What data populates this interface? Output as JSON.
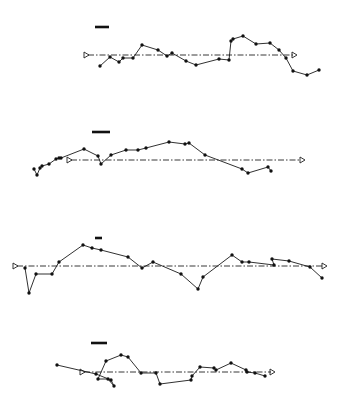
{
  "figure": {
    "width": 350,
    "height": 413,
    "background": "#ffffff",
    "ink": "#111111"
  },
  "chart_data": [
    {
      "type": "line",
      "panel": 1,
      "title": "",
      "xlabel": "",
      "ylabel": "",
      "grid": false,
      "legend": null,
      "scale_bar": {
        "x1": 95,
        "x2": 109,
        "y": 27
      },
      "baseline": {
        "x1": 84,
        "x2": 297,
        "y": 55
      },
      "points": [
        [
          100,
          66
        ],
        [
          110,
          57
        ],
        [
          119,
          62
        ],
        [
          123,
          58
        ],
        [
          133,
          58
        ],
        [
          142,
          45
        ],
        [
          158,
          50
        ],
        [
          167,
          56
        ],
        [
          172,
          53
        ],
        [
          186,
          61
        ],
        [
          196,
          65
        ],
        [
          219,
          59
        ],
        [
          229,
          60
        ],
        [
          231,
          41
        ],
        [
          233,
          39
        ],
        [
          243,
          36
        ],
        [
          256,
          44
        ],
        [
          270,
          43
        ],
        [
          279,
          50
        ],
        [
          286,
          58
        ],
        [
          293,
          71
        ],
        [
          307,
          75
        ],
        [
          319,
          70
        ]
      ]
    },
    {
      "type": "line",
      "panel": 2,
      "title": "",
      "xlabel": "",
      "ylabel": "",
      "grid": false,
      "legend": null,
      "scale_bar": {
        "x1": 92,
        "x2": 110,
        "y": 132
      },
      "baseline": {
        "x1": 67,
        "x2": 305,
        "y": 160
      },
      "points": [
        [
          34,
          169
        ],
        [
          37,
          175
        ],
        [
          40,
          168
        ],
        [
          42,
          166
        ],
        [
          49,
          164
        ],
        [
          56,
          159
        ],
        [
          59,
          158
        ],
        [
          61,
          158
        ],
        [
          84,
          149
        ],
        [
          98,
          156
        ],
        [
          101,
          164
        ],
        [
          111,
          155
        ],
        [
          126,
          150
        ],
        [
          138,
          150
        ],
        [
          146,
          148
        ],
        [
          169,
          142
        ],
        [
          185,
          144
        ],
        [
          189,
          143
        ],
        [
          205,
          155
        ],
        [
          242,
          169
        ],
        [
          248,
          173
        ],
        [
          268,
          167
        ],
        [
          271,
          171
        ]
      ]
    },
    {
      "type": "line",
      "panel": 3,
      "title": "",
      "xlabel": "",
      "ylabel": "",
      "grid": false,
      "legend": null,
      "scale_bar": {
        "x1": 95,
        "x2": 102,
        "y": 238
      },
      "baseline": {
        "x1": 13,
        "x2": 327,
        "y": 266
      },
      "points": [
        [
          25,
          268
        ],
        [
          29,
          293
        ],
        [
          36,
          274
        ],
        [
          52,
          274
        ],
        [
          59,
          262
        ],
        [
          83,
          245
        ],
        [
          92,
          248
        ],
        [
          101,
          250
        ],
        [
          128,
          257
        ],
        [
          142,
          268
        ],
        [
          153,
          262
        ],
        [
          181,
          274
        ],
        [
          198,
          289
        ],
        [
          203,
          277
        ],
        [
          232,
          255
        ],
        [
          242,
          262
        ],
        [
          249,
          262
        ],
        [
          274,
          265
        ],
        [
          272,
          259
        ],
        [
          289,
          261
        ],
        [
          310,
          267
        ],
        [
          322,
          278
        ]
      ]
    },
    {
      "type": "line",
      "panel": 4,
      "title": "",
      "xlabel": "",
      "ylabel": "",
      "grid": false,
      "legend": null,
      "scale_bar": {
        "x1": 91,
        "x2": 107,
        "y": 343
      },
      "baseline": {
        "x1": 80,
        "x2": 275,
        "y": 372
      },
      "points": [
        [
          57,
          365
        ],
        [
          96,
          374
        ],
        [
          111,
          380
        ],
        [
          114,
          386
        ],
        [
          108,
          379
        ],
        [
          98,
          379
        ],
        [
          106,
          361
        ],
        [
          121,
          355
        ],
        [
          128,
          357
        ],
        [
          141,
          373
        ],
        [
          156,
          373
        ],
        [
          160,
          384
        ],
        [
          191,
          380
        ],
        [
          192,
          376
        ],
        [
          200,
          367
        ],
        [
          214,
          368
        ],
        [
          216,
          370
        ],
        [
          231,
          363
        ],
        [
          246,
          370
        ],
        [
          247,
          372
        ],
        [
          255,
          373
        ],
        [
          265,
          376
        ]
      ]
    }
  ]
}
